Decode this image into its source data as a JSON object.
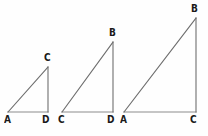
{
  "figure": {
    "background_color": "#fefefe",
    "line_color": "#6e6e6e",
    "base_line_color": "#8c8c8c",
    "label_color": "#1a1a1a",
    "width": 208,
    "height": 136
  },
  "triangles": [
    {
      "id": "triangle-small",
      "labels": {
        "bottom_left": "A",
        "bottom_right": "D",
        "apex": "C"
      },
      "points": {
        "bottom_left": [
          8,
          112
        ],
        "bottom_right": [
          48,
          112
        ],
        "apex": [
          48,
          67
        ]
      },
      "label_positions": {
        "bottom_left": [
          4,
          114
        ],
        "bottom_right": [
          42,
          114
        ],
        "apex": [
          44,
          52
        ]
      }
    },
    {
      "id": "triangle-medium",
      "labels": {
        "bottom_left": "C",
        "bottom_right": "D",
        "apex": "B"
      },
      "points": {
        "bottom_left": [
          62,
          112
        ],
        "bottom_right": [
          113,
          112
        ],
        "apex": [
          113,
          42
        ]
      },
      "label_positions": {
        "bottom_left": [
          58,
          114
        ],
        "bottom_right": [
          107,
          114
        ],
        "apex": [
          109,
          27
        ]
      }
    },
    {
      "id": "triangle-large",
      "labels": {
        "bottom_left": "A",
        "bottom_right": "C",
        "apex": "B"
      },
      "points": {
        "bottom_left": [
          124,
          112
        ],
        "bottom_right": [
          196,
          112
        ],
        "apex": [
          196,
          18
        ]
      },
      "label_positions": {
        "bottom_left": [
          120,
          114
        ],
        "bottom_right": [
          190,
          114
        ],
        "apex": [
          191,
          3
        ]
      }
    }
  ]
}
